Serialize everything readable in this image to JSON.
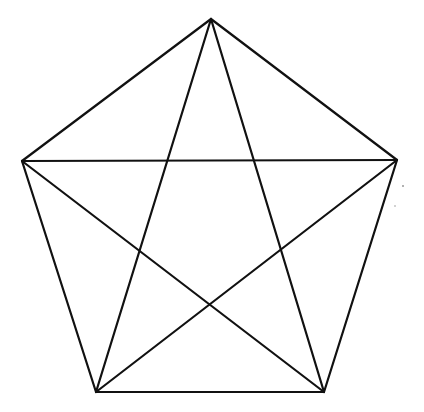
{
  "diagram": {
    "stroke_color": "#111111",
    "background": "#ffffff",
    "vertices": [
      {
        "id": "top",
        "x": 211,
        "y": 19
      },
      {
        "id": "right",
        "x": 397,
        "y": 160
      },
      {
        "id": "bottom-right",
        "x": 324,
        "y": 392
      },
      {
        "id": "bottom-left",
        "x": 96,
        "y": 392
      },
      {
        "id": "left",
        "x": 22,
        "y": 161
      }
    ],
    "edges": [
      {
        "from": "top",
        "to": "right",
        "kind": "side"
      },
      {
        "from": "right",
        "to": "bottom-right",
        "kind": "side"
      },
      {
        "from": "bottom-right",
        "to": "bottom-left",
        "kind": "side"
      },
      {
        "from": "bottom-left",
        "to": "left",
        "kind": "side"
      },
      {
        "from": "left",
        "to": "top",
        "kind": "side"
      },
      {
        "from": "top",
        "to": "bottom-right",
        "kind": "diagonal"
      },
      {
        "from": "top",
        "to": "bottom-left",
        "kind": "diagonal"
      },
      {
        "from": "left",
        "to": "right",
        "kind": "diagonal"
      },
      {
        "from": "left",
        "to": "bottom-right",
        "kind": "diagonal"
      },
      {
        "from": "right",
        "to": "bottom-left",
        "kind": "diagonal"
      }
    ]
  }
}
